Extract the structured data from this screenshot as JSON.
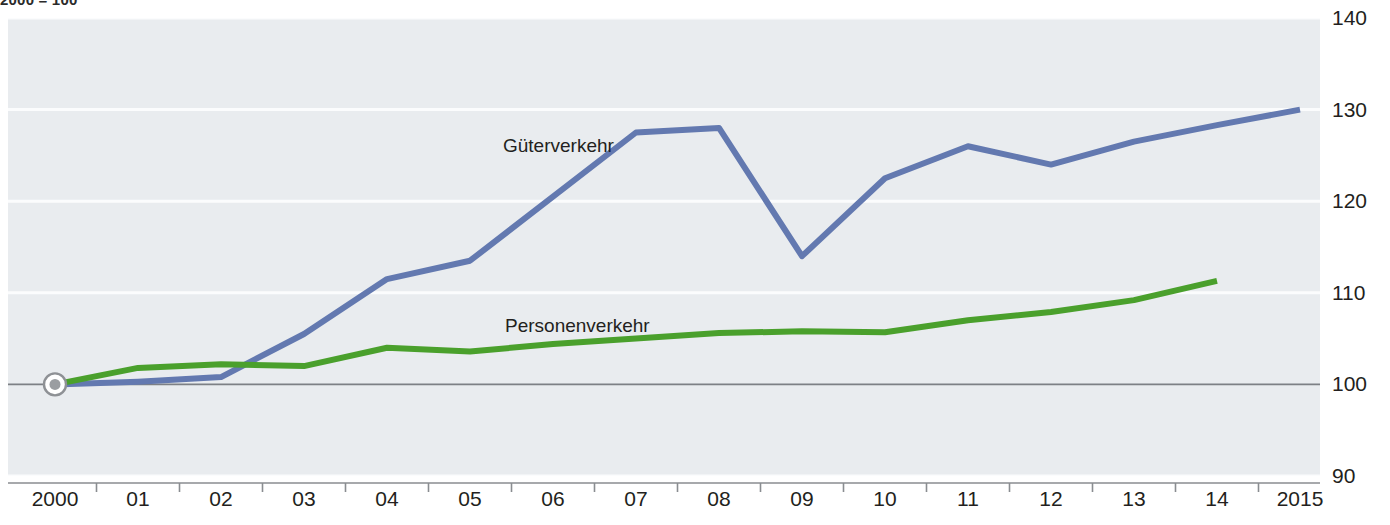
{
  "caption": {
    "text": "2000 = 100"
  },
  "chart_data": {
    "type": "line",
    "title": "",
    "subtitle": "",
    "xlabel": "",
    "ylabel": "",
    "index_base_note": "2000 = 100",
    "grid": true,
    "legend_position": "inline-on-series",
    "x": [
      "2000",
      "01",
      "02",
      "03",
      "04",
      "05",
      "06",
      "07",
      "08",
      "09",
      "10",
      "11",
      "12",
      "13",
      "14",
      "2015"
    ],
    "x_tick_labels": [
      "2000",
      "01",
      "02",
      "03",
      "04",
      "05",
      "06",
      "07",
      "08",
      "09",
      "10",
      "11",
      "12",
      "13",
      "14",
      "2015"
    ],
    "y_tick_labels": [
      "140",
      "130",
      "120",
      "110",
      "100",
      "90"
    ],
    "y_ticks": [
      140,
      130,
      120,
      110,
      100,
      90
    ],
    "ylim": [
      90,
      140
    ],
    "baseline_value": 100,
    "origin_marker": {
      "x": "2000",
      "y": 100
    },
    "series": [
      {
        "name": "Güterverkehr",
        "color": "#6379b0",
        "x": [
          "2000",
          "01",
          "02",
          "03",
          "04",
          "05",
          "06",
          "07",
          "08",
          "09",
          "10",
          "11",
          "12",
          "13",
          "14",
          "2015"
        ],
        "values": [
          100,
          100.3,
          100.8,
          105.5,
          111.5,
          113.5,
          120.5,
          127.5,
          128.0,
          114.0,
          122.5,
          126.0,
          124.0,
          126.5,
          128.3,
          130.0
        ]
      },
      {
        "name": "Personenverkehr",
        "color": "#4aa02c",
        "x": [
          "2000",
          "01",
          "02",
          "03",
          "04",
          "05",
          "06",
          "07",
          "08",
          "09",
          "10",
          "11",
          "12",
          "13",
          "14"
        ],
        "values": [
          100,
          101.8,
          102.2,
          102.0,
          104.0,
          103.6,
          104.4,
          105.0,
          105.6,
          105.8,
          105.7,
          107.0,
          107.9,
          109.2,
          111.3
        ]
      }
    ],
    "colors": {
      "freight": "#6379b0",
      "passenger": "#4aa02c",
      "plot_background": "#e9ecef",
      "gridline": "#fbfcfd",
      "baseline": "#7d8085",
      "axis": "#8a8d91",
      "text": "#231f20"
    }
  }
}
